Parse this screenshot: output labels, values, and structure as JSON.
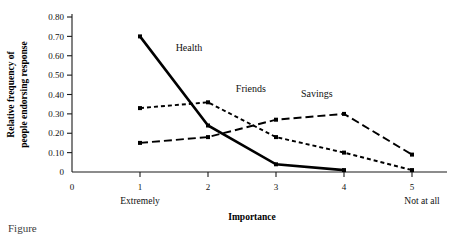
{
  "chart_data": {
    "type": "line",
    "title": "",
    "xlabel": "Importance",
    "ylabel": "Relative frequency of people endorsing response",
    "x": [
      1,
      2,
      3,
      4,
      5
    ],
    "xtick_labels": [
      "0",
      "1",
      "2",
      "3",
      "4",
      "5"
    ],
    "xtick_values": [
      0,
      1,
      2,
      3,
      4,
      5
    ],
    "xlim": [
      0,
      5.45
    ],
    "ytick_labels": [
      "0",
      "0.10",
      "0.20",
      "0.30",
      "0.40",
      "0.50",
      "0.60",
      "0.70",
      "0.80"
    ],
    "ytick_values": [
      0,
      0.1,
      0.2,
      0.3,
      0.4,
      0.5,
      0.6,
      0.7,
      0.8
    ],
    "ylim": [
      0,
      0.8
    ],
    "grid": false,
    "legend_position": "inline-annotations",
    "x_anchor_low": "Extremely",
    "x_anchor_high": "Not at all",
    "series": [
      {
        "name": "Health",
        "x": [
          1,
          2,
          3,
          4
        ],
        "values": [
          0.7,
          0.24,
          0.04,
          0.01
        ],
        "style": "solid",
        "color": "#000000",
        "label_x": 1.72,
        "label_y": 0.625
      },
      {
        "name": "Friends",
        "x": [
          1,
          2,
          3,
          4,
          5
        ],
        "values": [
          0.33,
          0.36,
          0.18,
          0.1,
          0.01
        ],
        "style": "dotted",
        "color": "#000000",
        "label_x": 2.63,
        "label_y": 0.415
      },
      {
        "name": "Savings",
        "x": [
          1,
          2,
          3,
          4,
          5
        ],
        "values": [
          0.15,
          0.18,
          0.27,
          0.3,
          0.09
        ],
        "style": "dashed",
        "color": "#000000",
        "label_x": 3.6,
        "label_y": 0.385
      }
    ]
  },
  "caption": {
    "text": "Figure"
  }
}
